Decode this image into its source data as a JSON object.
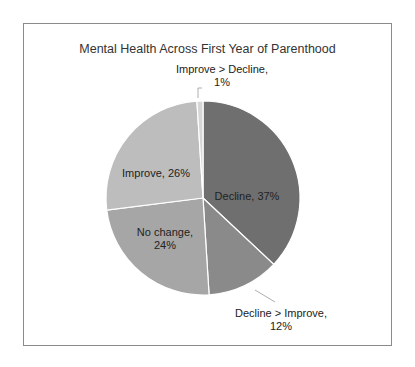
{
  "chart_data": {
    "type": "pie",
    "title": "Mental Health Across First Year of Parenthood",
    "categories": [
      "Decline",
      "Decline > Improve",
      "No change",
      "Improve",
      "Improve > Decline"
    ],
    "values": [
      37,
      12,
      24,
      26,
      1
    ],
    "unit": "%",
    "colors": [
      "#6f6f6f",
      "#8a8a8a",
      "#a6a6a6",
      "#bdbdbd",
      "#d6d6d6"
    ],
    "labels": [
      {
        "line1": "Decline, 37%",
        "line2": ""
      },
      {
        "line1": "Decline > Improve,",
        "line2": "12%"
      },
      {
        "line1": "No change,",
        "line2": "24%"
      },
      {
        "line1": "Improve, 26%",
        "line2": ""
      },
      {
        "line1": "Improve > Decline,",
        "line2": "1%"
      }
    ],
    "legend": "none",
    "start_angle": "12 o'clock, clockwise"
  }
}
